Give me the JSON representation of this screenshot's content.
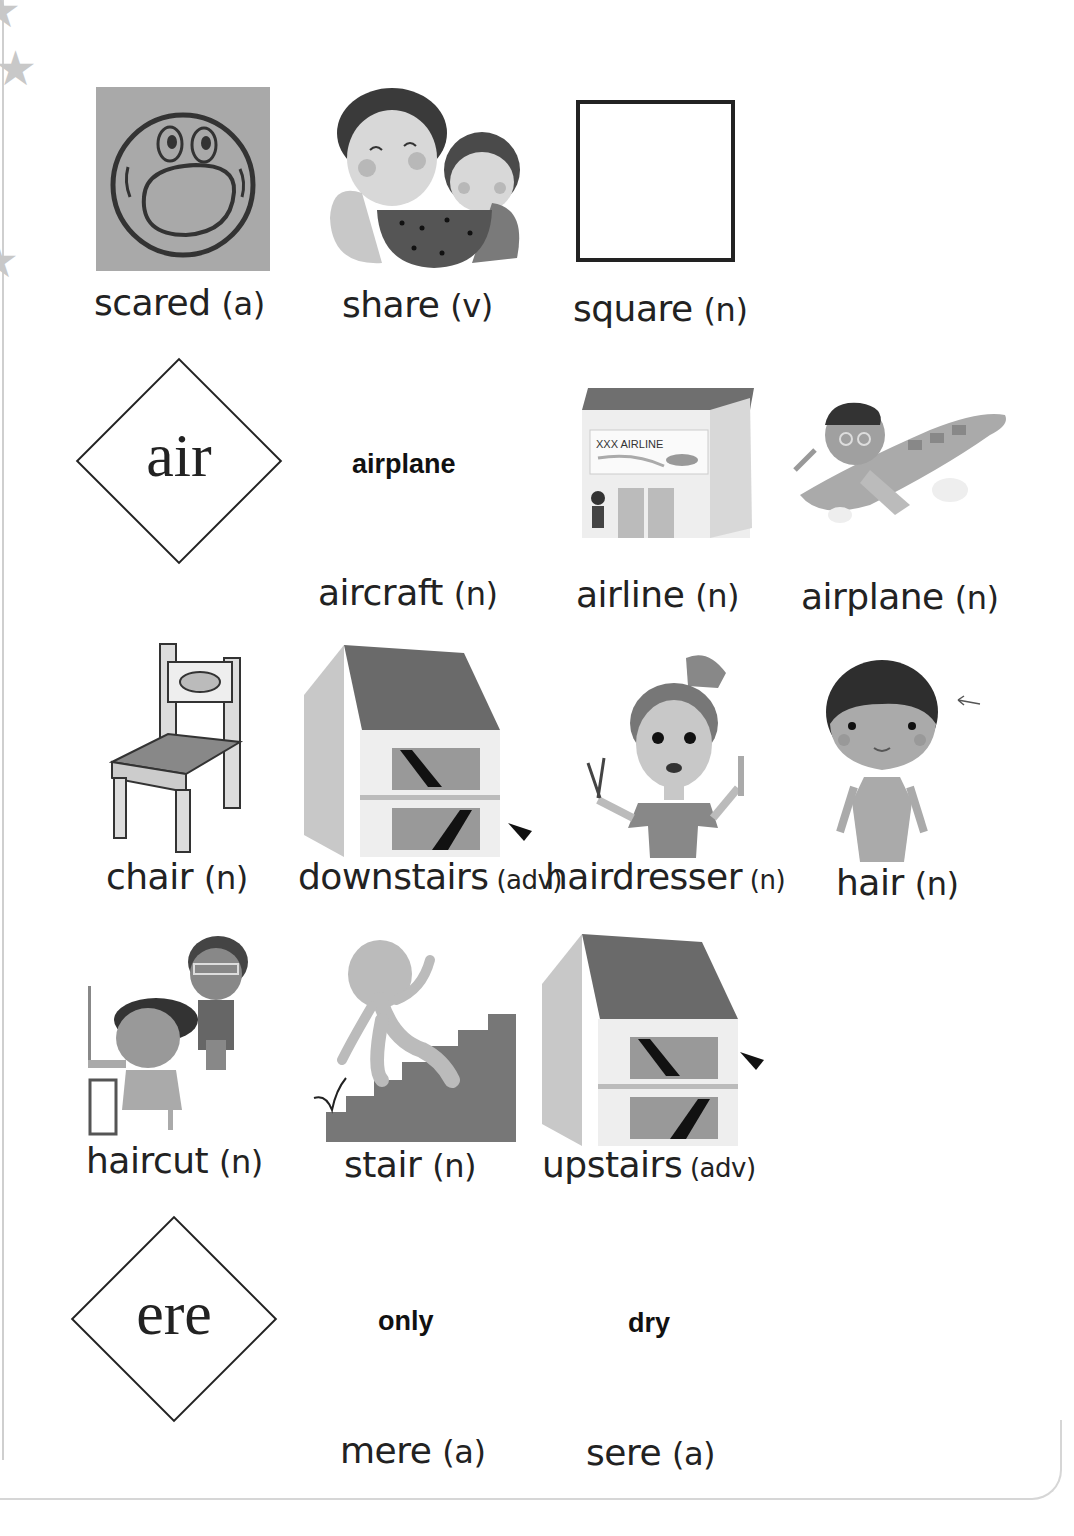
{
  "decorations": {
    "stars": [
      "star-icon",
      "star-icon",
      "star-icon"
    ]
  },
  "row1": {
    "items": [
      {
        "word": "scared",
        "pos": "(a)",
        "image": "scared-face-icon"
      },
      {
        "word": "share",
        "pos": "(v)",
        "image": "mother-child-sharing-watermelon-illustration"
      },
      {
        "word": "square",
        "pos": "(n)",
        "image": "square-outline-icon"
      }
    ]
  },
  "air_section": {
    "pattern": "air",
    "hint_word": "airplane",
    "items": [
      {
        "word": "aircraft",
        "pos": "(n)",
        "image": null
      },
      {
        "word": "airline",
        "pos": "(n)",
        "image": "airline-office-illustration",
        "sign_text": "XXX AIRLINE"
      },
      {
        "word": "airplane",
        "pos": "(n)",
        "image": "boy-riding-airplane-illustration"
      }
    ]
  },
  "row3": {
    "items": [
      {
        "word": "chair",
        "pos": "(n)",
        "image": "wooden-chair-illustration"
      },
      {
        "word": "downstairs",
        "pos": "(adv)",
        "image": "house-downstairs-arrow-illustration"
      },
      {
        "word": "hairdresser",
        "pos": "(n)",
        "image": "hairdresser-woman-illustration"
      },
      {
        "word": "hair",
        "pos": "(n)",
        "image": "boy-hair-arrow-illustration"
      }
    ]
  },
  "row4": {
    "items": [
      {
        "word": "haircut",
        "pos": "(n)",
        "image": "barber-cutting-hair-illustration"
      },
      {
        "word": "stair",
        "pos": "(n)",
        "image": "figure-climbing-stairs-illustration"
      },
      {
        "word": "upstairs",
        "pos": "(adv)",
        "image": "house-upstairs-arrow-illustration"
      }
    ]
  },
  "ere_section": {
    "pattern": "ere",
    "hint_words": [
      "only",
      "dry"
    ],
    "items": [
      {
        "word": "mere",
        "pos": "(a)"
      },
      {
        "word": "sere",
        "pos": "(a)"
      }
    ]
  }
}
